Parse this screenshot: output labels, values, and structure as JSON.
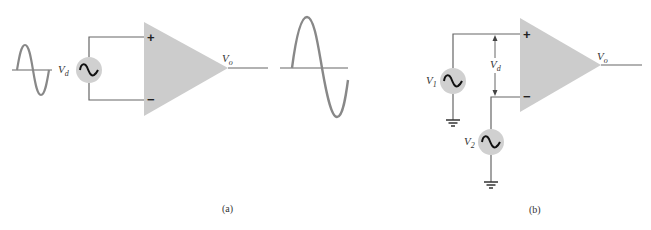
{
  "figure": {
    "panels": [
      {
        "id": "a",
        "caption": "(a)",
        "input_label": "V",
        "input_sub": "d",
        "output_label": "V",
        "output_sub": "o",
        "plus_sign": "+",
        "minus_sign": "−",
        "description": "Single-ended differential input V_d applied between + and − inputs; small input sine wave produces amplified output sine wave"
      },
      {
        "id": "b",
        "caption": "(b)",
        "source1_label": "V",
        "source1_sub": "1",
        "source2_label": "V",
        "source2_sub": "2",
        "diff_label": "V",
        "diff_sub": "d",
        "output_label": "V",
        "output_sub": "o",
        "plus_sign": "+",
        "minus_sign": "−",
        "description": "Two grounded sources V1 (to + input) and V2 (to − input); V_d is the difference between inputs"
      }
    ],
    "colors": {
      "amplifier_fill": "#cccccc",
      "source_fill": "#d0d0d0",
      "wire": "#666666",
      "waveform": "#888888",
      "text": "#333333"
    }
  }
}
